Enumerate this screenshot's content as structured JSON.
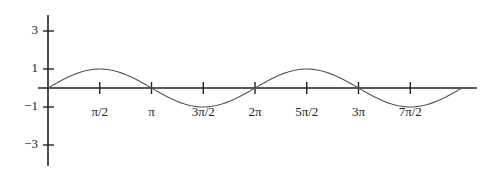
{
  "chart_data": {
    "type": "line",
    "title": "",
    "xlabel": "",
    "ylabel": "",
    "function": "sin(x)",
    "x_range": [
      0,
      12.566
    ],
    "xlim": [
      0,
      14.0
    ],
    "ylim": [
      -4,
      4
    ],
    "grid": false,
    "legend": null,
    "x_ticks": [
      {
        "value": 1.5708,
        "label": "π/2"
      },
      {
        "value": 3.1416,
        "label": "π"
      },
      {
        "value": 4.7124,
        "label": "3π/2"
      },
      {
        "value": 6.2832,
        "label": "2π"
      },
      {
        "value": 7.854,
        "label": "5π/2"
      },
      {
        "value": 9.4248,
        "label": "3π"
      },
      {
        "value": 10.9956,
        "label": "7π/2"
      }
    ],
    "y_ticks": [
      {
        "value": 3,
        "label": "3"
      },
      {
        "value": 1,
        "label": "1"
      },
      {
        "value": -1,
        "label": "−1"
      },
      {
        "value": -3,
        "label": "−3"
      }
    ],
    "series": [
      {
        "name": "y = sin x",
        "x": [
          0,
          0.7854,
          1.5708,
          2.3562,
          3.1416,
          3.927,
          4.7124,
          5.4978,
          6.2832,
          7.0686,
          7.854,
          8.6394,
          9.4248,
          10.2102,
          10.9956,
          11.781,
          12.5664
        ],
        "y": [
          0,
          0.707,
          1,
          0.707,
          0,
          -0.707,
          -1,
          -0.707,
          0,
          0.707,
          1,
          0.707,
          0,
          -0.707,
          -1,
          -0.707,
          0
        ]
      }
    ]
  },
  "colors": {
    "axis": "#222222",
    "curve": "#555555",
    "background": "#ffffff"
  }
}
